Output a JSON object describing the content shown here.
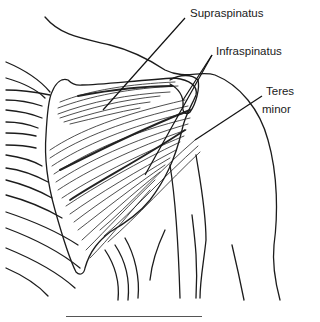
{
  "figure": {
    "labels": [
      {
        "id": "supraspinatus",
        "text": "Supraspinatus"
      },
      {
        "id": "infraspinatus",
        "text": "Infraspinatus"
      },
      {
        "id": "teres_minor_line1",
        "text": "Teres"
      },
      {
        "id": "teres_minor_line2",
        "text": "minor"
      }
    ],
    "ink_color": "#1c1c1c",
    "background": "#ffffff"
  }
}
